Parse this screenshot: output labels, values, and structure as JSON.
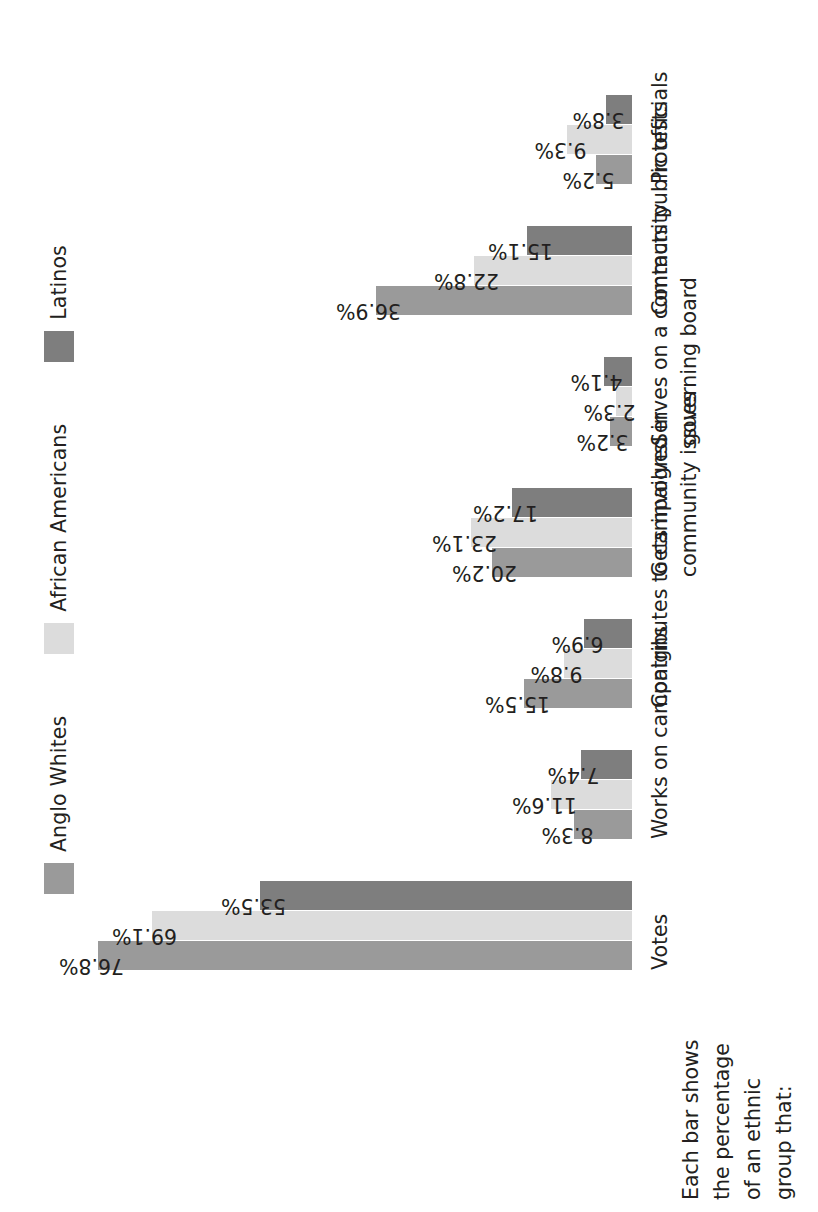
{
  "figure": {
    "axis_caption_lines": [
      "Each bar shows",
      "the percentage",
      "of an ethnic",
      "group that:"
    ]
  },
  "chart_data": {
    "type": "bar",
    "title": "",
    "subtitle": "",
    "xlabel": "Each bar shows the percentage of an ethnic group that:",
    "ylabel": "",
    "orientation": "vertical",
    "grid": false,
    "legend_position": "top",
    "value_suffix": "%",
    "ylim": [
      0,
      80
    ],
    "categories": [
      "Votes",
      "Works on campaigns",
      "Contributes to campaigns",
      "Gets involved in community issues",
      "Serves on a community governing board",
      "Contacts public officials",
      "Protests"
    ],
    "category_lines": [
      [
        "Votes"
      ],
      [
        "Works on campaigns"
      ],
      [
        "Contributes to campaigns"
      ],
      [
        "Gets involved in",
        "community issues"
      ],
      [
        "Serves on a community",
        "governing board"
      ],
      [
        "Contacts public officials"
      ],
      [
        "Protests"
      ]
    ],
    "series": [
      {
        "name": "Anglo Whites",
        "color": "#9a9a9a",
        "values": [
          76.8,
          8.3,
          15.5,
          20.2,
          3.2,
          36.9,
          5.2
        ],
        "labels": [
          "76.8%",
          "8.3%",
          "15.5%",
          "20.2%",
          "3.2%",
          "36.9%",
          "5.2%"
        ]
      },
      {
        "name": "African Americans",
        "color": "#dcdcdc",
        "values": [
          69.1,
          11.6,
          9.8,
          23.1,
          2.3,
          22.8,
          9.3
        ],
        "labels": [
          "69.1%",
          "11.6%",
          "9.8%",
          "23.1%",
          "2.3%",
          "22.8%",
          "9.3%"
        ]
      },
      {
        "name": "Latinos",
        "color": "#7e7e7e",
        "values": [
          53.5,
          7.4,
          6.9,
          17.2,
          4.1,
          15.1,
          3.8
        ],
        "labels": [
          "53.5%",
          "7.4%",
          "6.9%",
          "17.2%",
          "4.1%",
          "15.1%",
          "3.8%"
        ]
      }
    ]
  }
}
